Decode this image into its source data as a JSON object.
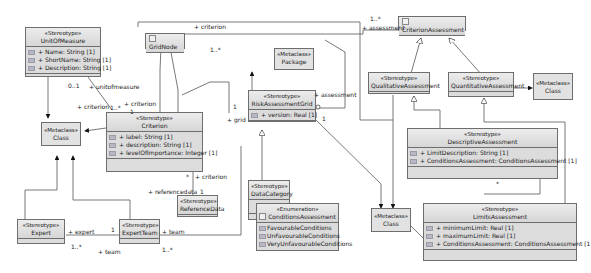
{
  "classes": {
    "unit_of_measure": {
      "stereotype": "«Stereotype»",
      "name": "UnitOfMeasure",
      "attributes": [
        "+ Name: String [1]",
        "+ ShortName: String [1]",
        "+ Description: String [1]"
      ]
    },
    "grid_node": {
      "name": "GridNode"
    },
    "criterion_assessment": {
      "name": "CriterionAssessment"
    },
    "package_metaclass": {
      "stereotype": "«Metaclass»",
      "name": "Package"
    },
    "class_metaclass_left": {
      "stereotype": "«Metaclass»",
      "name": "Class"
    },
    "criterion": {
      "stereotype": "«Stereotype»",
      "name": "Criterion",
      "attributes": [
        "+ label: String [1]",
        "+ description: String [1]",
        "+ levelOfImportance: Integer [1]"
      ]
    },
    "risk_assessment_grid": {
      "stereotype": "«Stereotype»",
      "name": "RiskAssessmentGrid",
      "attributes": [
        "+ version: Real [1]"
      ]
    },
    "qualitative_assessment": {
      "stereotype": "«Stereotype»",
      "name": "QualitativeAssessment"
    },
    "quantitative_assessment": {
      "stereotype": "«Stereotype»",
      "name": "QuantitativeAssessment"
    },
    "class_metaclass_right": {
      "stereotype": "«Metaclass»",
      "name": "Class"
    },
    "descriptive_assessment": {
      "stereotype": "«Stereotype»",
      "name": "DescriptiveAssessment",
      "attributes": [
        "+ LimitDescription: String [1]",
        "+ ConditionsAssessment: ConditionsAssessment [1]"
      ]
    },
    "data_category": {
      "stereotype": "«Stereotype»",
      "name": "DataCategory"
    },
    "reference_data": {
      "stereotype": "«Stereotype»",
      "name": "ReferenceData"
    },
    "conditions_assessment": {
      "stereotype": "«Enumeration»",
      "name": "ConditionsAssessment",
      "literals": [
        "FavourableConditions",
        "UnFavourableConditions",
        "VeryUnfavourableConditions"
      ]
    },
    "class_metaclass_bottom": {
      "stereotype": "«Metaclass»",
      "name": "Class"
    },
    "limits_assessment": {
      "stereotype": "«Stereotype»",
      "name": "LimitsAssessment",
      "attributes": [
        "+ minimumLimit: Real [1]",
        "+ maximumLimit: Real [1]",
        "+ ConditionsAssessment: ConditionsAssessment [1]"
      ]
    },
    "expert": {
      "stereotype": "«Stereotype»",
      "name": "Expert"
    },
    "expert_team": {
      "stereotype": "«Stereotype»",
      "name": "ExpertTeam"
    }
  },
  "labels": {
    "criterion_top": "+ criterion",
    "mult_1_star_top": "1..*",
    "assessment_top": "+ assessment",
    "mult_1_star_top_right": "1..*",
    "mult_0_1": "0..1",
    "unitofmeasure": "+ unitofmeasure",
    "criterion_left": "+ criterion",
    "mult_1_star_crit": "1..*",
    "criterion_mid": "+ criterion",
    "mult_1_crit": "1",
    "mult_1_grid": "1",
    "grid": "+ grid",
    "assessment_mid": "+ assessment",
    "mult_1_rag": "1",
    "mult_star_ref": "*",
    "criterion_ref": "+ criterion",
    "referencedata": "+ referencedata",
    "mult_1_ref": "1",
    "expert": "+ expert",
    "mult_1_expert": "1",
    "mult_1_star_expert": "1..*",
    "team_bottom": "+ team",
    "team_right": "+ team",
    "mult_1_star_team": "1..*",
    "mult_star_desc": "*"
  }
}
